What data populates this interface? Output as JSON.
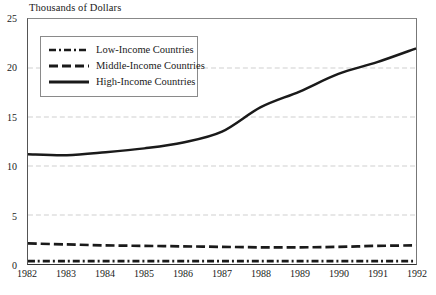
{
  "chart_data": {
    "type": "line",
    "title": "Thousands of Dollars",
    "xlabel": "",
    "ylabel": "Thousands of Dollars",
    "x": [
      1982,
      1983,
      1984,
      1985,
      1986,
      1987,
      1988,
      1989,
      1990,
      1991,
      1992
    ],
    "categories": [
      "1982",
      "1983",
      "1984",
      "1985",
      "1986",
      "1987",
      "1988",
      "1989",
      "1990",
      "1991",
      "1992"
    ],
    "xlim": [
      1982,
      1992
    ],
    "ylim": [
      0,
      25
    ],
    "yticks": [
      0,
      5,
      10,
      15,
      20,
      25
    ],
    "xticks": [
      "1982",
      "1983",
      "1984",
      "1985",
      "1986",
      "1987",
      "1988",
      "1989",
      "1990",
      "1991",
      "1992"
    ],
    "grid": "horizontal-dashed",
    "legend_position": "upper-left",
    "series": [
      {
        "name": "Low-Income Countries",
        "style": "dash-dot",
        "color": "#1a1a1a",
        "values": [
          0.3,
          0.3,
          0.3,
          0.3,
          0.3,
          0.3,
          0.3,
          0.3,
          0.3,
          0.3,
          0.3
        ]
      },
      {
        "name": "Middle-Income Countries",
        "style": "dashed",
        "color": "#1a1a1a",
        "values": [
          2.1,
          2.0,
          1.9,
          1.85,
          1.8,
          1.75,
          1.7,
          1.7,
          1.75,
          1.85,
          1.9
        ]
      },
      {
        "name": "High-Income Countries",
        "style": "solid",
        "color": "#1a1a1a",
        "values": [
          11.2,
          11.1,
          11.4,
          11.8,
          12.4,
          13.5,
          16.0,
          17.6,
          19.4,
          20.6,
          22.0
        ]
      }
    ]
  },
  "legend": {
    "items": [
      {
        "label": "Low-Income Countries",
        "key": "dash-dot-line-icon"
      },
      {
        "label": "Middle-Income Countries",
        "key": "dashed-line-icon"
      },
      {
        "label": "High-Income Countries",
        "key": "solid-line-icon"
      }
    ]
  }
}
